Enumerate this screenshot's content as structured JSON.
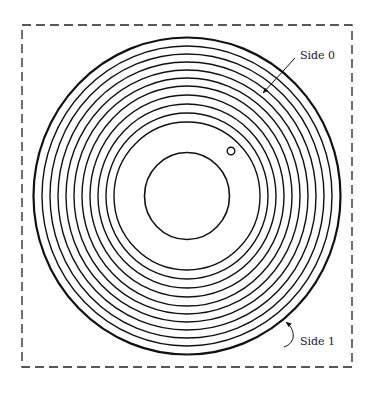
{
  "diagram": {
    "type": "floppy-disk-track-diagram",
    "colors": {
      "stroke": "#111111",
      "background": "#ffffff",
      "border": "#222222"
    },
    "border": {
      "x": 22,
      "y": 25,
      "width": 330,
      "height": 342,
      "style": "dashed"
    },
    "disk": {
      "center": {
        "x": 187,
        "y": 196
      },
      "outer_edge": {
        "rx": 153.5,
        "ry": 158.5,
        "stroke_width": 2.2
      },
      "tracks": [
        {
          "rx": 145,
          "ry": 150
        },
        {
          "rx": 137,
          "ry": 142
        },
        {
          "rx": 129,
          "ry": 134
        },
        {
          "rx": 121,
          "ry": 126
        },
        {
          "rx": 113,
          "ry": 118
        },
        {
          "rx": 105,
          "ry": 110
        },
        {
          "rx": 97,
          "ry": 101
        },
        {
          "rx": 89,
          "ry": 92
        },
        {
          "rx": 81,
          "ry": 83
        },
        {
          "rx": 73,
          "ry": 74
        }
      ],
      "track_stroke_width": 1.4,
      "spindle_hole": {
        "rx": 42.5,
        "ry": 43.5,
        "stroke_width": 1.6
      },
      "index_hole": {
        "cx": 231,
        "cy": 151,
        "r": 3.8
      }
    },
    "labels": {
      "side0": {
        "text": "Side 0",
        "x": 300,
        "y": 59
      },
      "side1": {
        "text": "Side 1",
        "x": 300,
        "y": 345
      }
    },
    "arrows": {
      "side0": {
        "from": {
          "x": 295,
          "y": 58
        },
        "to": {
          "x": 263,
          "y": 93
        }
      },
      "side1": {
        "path": "M 284 347 C 296 343, 296 330, 286 322",
        "tip": {
          "x": 284,
          "y": 320
        }
      }
    }
  }
}
